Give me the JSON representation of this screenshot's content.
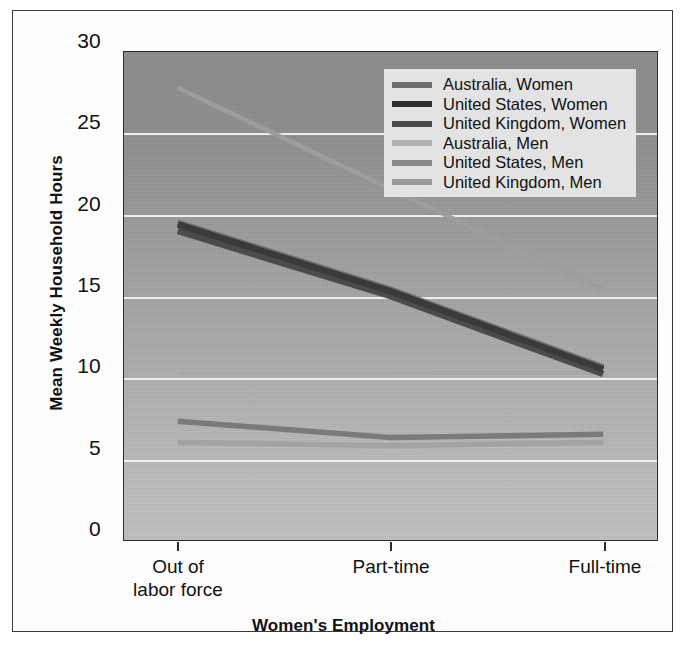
{
  "chart_data": {
    "type": "line",
    "title": "",
    "xlabel": "Women's Employment",
    "ylabel": "Mean Weekly Household Hours",
    "categories": [
      "Out of labor force",
      "Part-time",
      "Full-time"
    ],
    "category_lines": [
      [
        "Out of",
        "labor force"
      ],
      [
        "Part-time",
        ""
      ],
      [
        "Full-time",
        ""
      ]
    ],
    "ylim": [
      0,
      30
    ],
    "yticks": [
      0,
      5,
      10,
      15,
      20,
      25,
      30
    ],
    "ytick_labels": [
      "0",
      "5",
      "10",
      "15",
      "20",
      "25",
      "30"
    ],
    "grid": true,
    "legend_position": "top-right-inside",
    "series": [
      {
        "name": "Australia, Women",
        "values": [
          19.5,
          15.4,
          10.6
        ],
        "color": "#6e6e6e",
        "width": 6.5
      },
      {
        "name": "United States, Women",
        "values": [
          19.4,
          15.3,
          10.5
        ],
        "color": "#3a3a3a",
        "width": 6.5
      },
      {
        "name": "United Kingdom, Women",
        "values": [
          19.0,
          15.0,
          10.2
        ],
        "color": "#4b4b4b",
        "width": 6.5
      },
      {
        "name": "Australia, Men",
        "values": [
          27.8,
          21.6,
          15.4
        ],
        "color": "#9d9d9d",
        "width": 4.5
      },
      {
        "name": "United States, Men",
        "values": [
          7.3,
          6.3,
          6.5
        ],
        "color": "#7a7a7a",
        "width": 5.5
      },
      {
        "name": "United Kingdom, Men",
        "values": [
          6.0,
          5.8,
          6.0
        ],
        "color": "#a2a2a2",
        "width": 5.5
      }
    ],
    "extra_series": [
      {
        "name": "United Kingdom, Men flat upper",
        "values": [
          10.2,
          10.25,
          10.3
        ],
        "color": "#a8a8a8",
        "width": 3.0
      }
    ]
  },
  "legend": {
    "entries": [
      {
        "label": "Australia, Women",
        "color": "#6e6e6e"
      },
      {
        "label": "United States, Women",
        "color": "#2f2f2f"
      },
      {
        "label": "United Kingdom, Women",
        "color": "#4a4a4a"
      },
      {
        "label": "Australia, Men",
        "color": "#b0b0b0"
      },
      {
        "label": "United States, Men",
        "color": "#8a8a8a"
      },
      {
        "label": "United Kingdom, Men",
        "color": "#9b9b9b"
      }
    ]
  }
}
